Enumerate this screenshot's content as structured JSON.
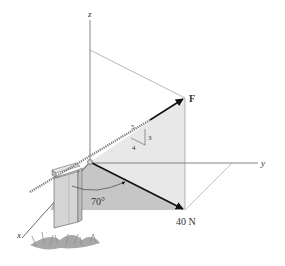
{
  "figure": {
    "axes": {
      "x_label": "x",
      "y_label": "y",
      "z_label": "z"
    },
    "force_label": "F",
    "projection_label": "40 N",
    "angle_label": "70°",
    "slope_triangle": {
      "hypotenuse": "5",
      "rise": "3",
      "run": "4"
    }
  },
  "colors": {
    "axis": "#555555",
    "vertical_plane": "#e6e6e6",
    "floor_shade": "#c4c4c4",
    "arrow": "#111111",
    "post": "#cfcfcf",
    "grass": "#9a9a9a"
  }
}
